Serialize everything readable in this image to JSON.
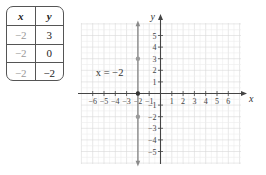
{
  "table": {
    "headers": [
      "x",
      "y"
    ],
    "rows": [
      {
        "x": "−2",
        "y": "3"
      },
      {
        "x": "−2",
        "y": "0"
      },
      {
        "x": "−2",
        "y": "−2"
      }
    ]
  },
  "chart_data": {
    "type": "line",
    "title": "",
    "xlabel": "x",
    "ylabel": "y",
    "xlim": [
      -7,
      7
    ],
    "ylim": [
      -6,
      6
    ],
    "grid": true,
    "x_ticks": [
      -6,
      -5,
      -4,
      -3,
      -2,
      -1,
      1,
      2,
      3,
      4,
      5,
      6
    ],
    "y_ticks": [
      -5,
      -4,
      -3,
      -2,
      -1,
      1,
      2,
      3,
      4,
      5
    ],
    "x_tick_labels": [
      "−6",
      "−5",
      "−4",
      "−3",
      "−2",
      "−1",
      "1",
      "2",
      "3",
      "4",
      "5",
      "6"
    ],
    "y_tick_labels": [
      "−5",
      "−4",
      "−3",
      "−2",
      "−1",
      "1",
      "2",
      "3",
      "4",
      "5"
    ],
    "series": [
      {
        "name": "x = −2",
        "type": "vertical-line",
        "x": -2,
        "points": [
          [
            -2,
            3
          ],
          [
            -2,
            0
          ],
          [
            -2,
            -2
          ]
        ]
      }
    ],
    "annotations": [
      {
        "text": "x = −2",
        "x": -4.5,
        "y": 1.8
      }
    ],
    "colors": {
      "line": "#8a8a8a",
      "axis": "#444444",
      "grid": "#dddddd",
      "point": "#9a9a9a"
    }
  }
}
